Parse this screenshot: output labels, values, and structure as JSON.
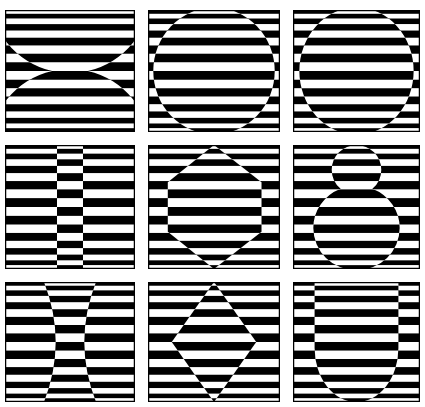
{
  "figure": {
    "type": "op-art-grid",
    "rows": 3,
    "cols": 3,
    "colors": {
      "ink": "#000000",
      "paper": "#ffffff"
    },
    "panels": [
      {
        "name": "hourglass-arcs",
        "shape": "two-circle-caps"
      },
      {
        "name": "circle",
        "shape": "circle"
      },
      {
        "name": "ring-with-inner-circle",
        "shape": "ring"
      },
      {
        "name": "vertical-band",
        "shape": "vertical-strip"
      },
      {
        "name": "hexagon",
        "shape": "hexagon"
      },
      {
        "name": "figure-eight",
        "shape": "two-circles"
      },
      {
        "name": "concave-hourglass",
        "shape": "concave-band"
      },
      {
        "name": "diamond",
        "shape": "diamond"
      },
      {
        "name": "u-shape",
        "shape": "u-shape"
      }
    ]
  }
}
